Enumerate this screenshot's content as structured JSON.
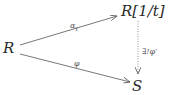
{
  "diagram": {
    "type": "commutative-diagram",
    "nodes": {
      "source": "R",
      "localization": "R[1/t]",
      "target": "S"
    },
    "arrows": {
      "top": {
        "from": "R",
        "to": "R[1/t]",
        "label": "α",
        "subscript": "t",
        "style": "solid"
      },
      "bottom": {
        "from": "R",
        "to": "S",
        "label": "φ",
        "style": "solid"
      },
      "vertical": {
        "from": "R[1/t]",
        "to": "S",
        "label": "∃!φ′",
        "style": "dotted"
      }
    },
    "colors": {
      "stroke": "#555555",
      "text": "#2a2a2a"
    }
  }
}
